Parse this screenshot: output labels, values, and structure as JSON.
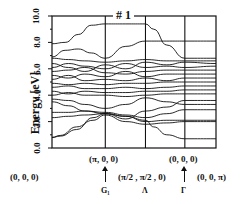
{
  "chart_data": {
    "type": "line",
    "title": "# 1",
    "xlabel": "",
    "ylabel": "Energy [eV]",
    "ylim": [
      0.0,
      10.0
    ],
    "yticks": [
      "0.0",
      "2.0",
      "4.0",
      "6.0",
      "8.0",
      "10.0"
    ],
    "grid": false,
    "legend": null,
    "k_path_segments": [
      {
        "from": "(0,0,0)",
        "to": "(π,0,0)"
      },
      {
        "from": "(π,0,0)",
        "to": "(π/2,π/2,0)"
      },
      {
        "from": "(π/2,π/2,0)",
        "to": "(0,0,0)"
      },
      {
        "from": "(0,0,0)",
        "to": "(0,0,π)"
      }
    ],
    "x_positions": [
      0.0,
      0.325,
      0.57,
      0.81,
      1.0
    ],
    "upper_labels": [
      "(π, 0, 0)",
      "(0, 0, 0)"
    ],
    "lower_labels": [
      "(0, 0, 0)",
      "(π/2 , π/2 , 0)",
      "(0, 0, π)"
    ],
    "symmetry_labels": [
      "G₁",
      "Λ",
      "Γ"
    ],
    "series": [
      {
        "name": "band-top-1",
        "x": [
          0.0,
          0.08,
          0.16,
          0.24,
          0.325,
          0.45,
          0.57,
          0.62,
          0.7,
          0.81,
          1.0
        ],
        "values": [
          7.9,
          8.0,
          8.6,
          9.3,
          9.4,
          9.4,
          9.4,
          9.0,
          7.8,
          6.8,
          6.8
        ]
      },
      {
        "name": "band-top-2",
        "x": [
          0.0,
          0.08,
          0.16,
          0.24,
          0.325,
          0.45,
          0.57,
          0.7,
          0.81,
          1.0
        ],
        "values": [
          6.9,
          7.4,
          7.5,
          7.2,
          6.8,
          7.7,
          8.1,
          8.1,
          8.1,
          8.1
        ]
      },
      {
        "name": "band-6.8",
        "x": [
          0.0,
          0.1,
          0.2,
          0.325,
          0.45,
          0.57,
          0.7,
          0.81,
          1.0
        ],
        "values": [
          6.8,
          6.7,
          6.6,
          6.5,
          6.6,
          6.7,
          6.6,
          6.6,
          6.6
        ]
      },
      {
        "name": "band-6.4",
        "x": [
          0.0,
          0.1,
          0.2,
          0.325,
          0.45,
          0.57,
          0.7,
          0.81,
          1.0
        ],
        "values": [
          6.4,
          6.1,
          5.8,
          6.3,
          6.0,
          6.5,
          6.3,
          6.5,
          6.4
        ]
      },
      {
        "name": "band-6.1",
        "x": [
          0.0,
          0.1,
          0.2,
          0.325,
          0.45,
          0.57,
          0.7,
          0.81,
          1.0
        ],
        "values": [
          6.1,
          6.4,
          6.2,
          6.0,
          6.4,
          6.1,
          6.2,
          6.1,
          6.2
        ]
      },
      {
        "name": "band-5.8",
        "x": [
          0.0,
          0.1,
          0.2,
          0.325,
          0.45,
          0.57,
          0.7,
          0.81,
          1.0
        ],
        "values": [
          5.8,
          5.9,
          6.1,
          5.7,
          5.6,
          5.8,
          5.9,
          5.9,
          5.9
        ]
      },
      {
        "name": "band-5.5",
        "x": [
          0.0,
          0.1,
          0.2,
          0.325,
          0.45,
          0.57,
          0.7,
          0.81,
          1.0
        ],
        "values": [
          5.5,
          5.3,
          5.6,
          5.4,
          5.8,
          5.4,
          5.6,
          5.6,
          5.6
        ]
      },
      {
        "name": "band-5.2",
        "x": [
          0.0,
          0.1,
          0.2,
          0.325,
          0.45,
          0.57,
          0.7,
          0.81,
          1.0
        ],
        "values": [
          5.2,
          5.5,
          5.1,
          5.2,
          5.1,
          5.3,
          5.1,
          5.3,
          5.3
        ]
      },
      {
        "name": "band-4.9",
        "x": [
          0.0,
          0.1,
          0.2,
          0.325,
          0.45,
          0.57,
          0.7,
          0.81,
          1.0
        ],
        "values": [
          4.9,
          4.8,
          4.9,
          4.8,
          4.9,
          4.9,
          5.0,
          5.0,
          5.0
        ]
      },
      {
        "name": "band-4.6",
        "x": [
          0.0,
          0.1,
          0.2,
          0.325,
          0.45,
          0.57,
          0.7,
          0.81,
          1.0
        ],
        "values": [
          4.6,
          4.7,
          4.5,
          4.5,
          4.6,
          4.5,
          4.6,
          4.7,
          4.7
        ]
      },
      {
        "name": "band-4.3",
        "x": [
          0.0,
          0.1,
          0.2,
          0.325,
          0.45,
          0.57,
          0.7,
          0.81,
          1.0
        ],
        "values": [
          4.3,
          4.1,
          4.3,
          4.2,
          4.2,
          4.3,
          4.3,
          4.4,
          4.4
        ]
      },
      {
        "name": "band-4.0",
        "x": [
          0.0,
          0.1,
          0.2,
          0.325,
          0.45,
          0.57,
          0.7,
          0.81,
          1.0
        ],
        "values": [
          4.0,
          4.2,
          4.0,
          4.0,
          3.9,
          4.0,
          4.1,
          4.1,
          4.1
        ]
      },
      {
        "name": "band-3.7",
        "x": [
          0.0,
          0.1,
          0.2,
          0.325,
          0.45,
          0.57,
          0.7,
          0.81,
          1.0
        ],
        "values": [
          3.7,
          3.6,
          3.3,
          3.0,
          3.3,
          3.8,
          3.5,
          3.3,
          3.3
        ]
      },
      {
        "name": "band-3.4",
        "x": [
          0.0,
          0.1,
          0.2,
          0.325,
          0.45,
          0.57,
          0.7,
          0.81,
          1.0
        ],
        "values": [
          3.5,
          3.2,
          2.8,
          2.7,
          2.5,
          2.3,
          2.6,
          2.9,
          2.9
        ]
      },
      {
        "name": "band-2.7",
        "x": [
          0.0,
          0.1,
          0.2,
          0.325,
          0.45,
          0.57,
          0.7,
          0.81,
          1.0
        ],
        "values": [
          2.7,
          2.7,
          2.8,
          2.6,
          2.2,
          2.8,
          3.1,
          3.6,
          3.6
        ]
      },
      {
        "name": "band-2.3",
        "x": [
          0.0,
          0.1,
          0.2,
          0.325,
          0.45,
          0.57,
          0.7,
          0.81,
          1.0
        ],
        "values": [
          2.3,
          2.4,
          2.5,
          2.6,
          2.4,
          2.0,
          2.1,
          2.1,
          2.1
        ]
      },
      {
        "name": "band-low-1",
        "x": [
          0.0,
          0.05,
          0.15,
          0.25,
          0.325,
          0.45,
          0.57,
          0.62,
          0.7,
          0.81,
          1.0
        ],
        "values": [
          0.8,
          0.9,
          1.4,
          2.3,
          2.6,
          2.4,
          2.1,
          1.6,
          1.0,
          0.7,
          0.7
        ]
      },
      {
        "name": "band-low-2",
        "x": [
          0.0,
          0.05,
          0.15,
          0.25,
          0.325,
          0.45,
          0.57,
          0.7,
          0.81,
          1.0
        ],
        "values": [
          0.8,
          0.95,
          1.6,
          2.1,
          2.5,
          2.0,
          1.8,
          1.9,
          2.0,
          2.0
        ]
      }
    ]
  },
  "colors": {
    "line": "#111111",
    "background": "#ffffff"
  }
}
